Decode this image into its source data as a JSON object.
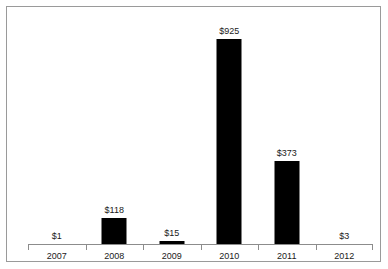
{
  "chart_data": {
    "type": "bar",
    "title": "",
    "subtitle": "",
    "xlabel": "",
    "ylabel": "",
    "categories": [
      "2007",
      "2008",
      "2009",
      "2010",
      "2011",
      "2012"
    ],
    "values": [
      1,
      118,
      15,
      925,
      373,
      3
    ],
    "value_labels": [
      "$1",
      "$118",
      "$15",
      "$925",
      "$373",
      "$3"
    ],
    "ylim": [
      0,
      925
    ],
    "grid": false,
    "legend": null,
    "legend_position": "none",
    "bar_color": "#000000",
    "axis_color": "#8c8c8c",
    "frame_color": "#9a9a9a",
    "background_color": "#ffffff",
    "text_color": "#1a1a1a",
    "annotations": []
  },
  "figure": {
    "frame_visible": true,
    "axis_ticks_visible": true
  }
}
